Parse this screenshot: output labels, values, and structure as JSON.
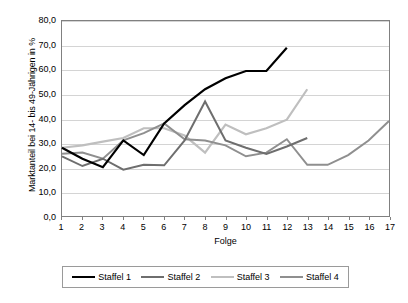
{
  "chart_data": {
    "type": "line",
    "title": "",
    "xlabel": "Folge",
    "ylabel": "Marktanteil bei 14- bis 49-Jährigen in %",
    "xlim": [
      1,
      17
    ],
    "ylim": [
      0,
      80
    ],
    "grid": true,
    "legend_position": "bottom",
    "x_tick_labels": [
      "1",
      "2",
      "3",
      "4",
      "5",
      "6",
      "7",
      "8",
      "9",
      "10",
      "11",
      "12",
      "13",
      "14",
      "15",
      "16",
      "17"
    ],
    "y_tick_labels": [
      "0,0",
      "10,0",
      "20,0",
      "30,0",
      "40,0",
      "50,0",
      "60,0",
      "70,0",
      "80,0"
    ],
    "y_ticks": [
      0,
      10,
      20,
      30,
      40,
      50,
      60,
      70,
      80
    ],
    "x": [
      1,
      2,
      3,
      4,
      5,
      6,
      7,
      8,
      9,
      10,
      11,
      12,
      13,
      14,
      15,
      16,
      17
    ],
    "series": [
      {
        "name": "Staffel 1",
        "color": "#000000",
        "width": 2.2,
        "x": [
          1,
          2,
          3,
          4,
          5,
          6,
          7,
          8,
          9,
          10,
          11,
          12
        ],
        "values": [
          28.0,
          23.5,
          20.0,
          31.0,
          25.0,
          38.0,
          45.5,
          52.0,
          56.5,
          59.5,
          59.5,
          69.0
        ]
      },
      {
        "name": "Staffel 2",
        "color": "#6e6e6e",
        "width": 2.0,
        "x": [
          1,
          2,
          3,
          4,
          5,
          6,
          7,
          8,
          9,
          10,
          11,
          12,
          13
        ],
        "values": [
          24.5,
          20.5,
          23.5,
          19.0,
          21.0,
          20.8,
          31.0,
          47.0,
          31.0,
          28.0,
          25.5,
          28.5,
          32.0
        ]
      },
      {
        "name": "Staffel 3",
        "color": "#bfbfbf",
        "width": 2.2,
        "x": [
          1,
          2,
          3,
          4,
          5,
          6,
          7,
          8,
          9,
          10,
          11,
          12,
          13
        ],
        "values": [
          28.0,
          29.0,
          30.5,
          32.0,
          36.0,
          36.0,
          33.0,
          26.0,
          37.5,
          33.5,
          36.0,
          39.5,
          52.0
        ]
      },
      {
        "name": "Staffel 4",
        "color": "#8f8f8f",
        "width": 2.0,
        "x": [
          1,
          2,
          3,
          4,
          5,
          6,
          7,
          8,
          9,
          10,
          11,
          12,
          13,
          14,
          15,
          16,
          17
        ],
        "values": [
          25.5,
          26.0,
          23.5,
          31.0,
          34.0,
          38.0,
          31.5,
          31.0,
          29.0,
          24.5,
          26.0,
          31.5,
          21.0,
          21.0,
          25.0,
          31.0,
          39.0
        ]
      }
    ]
  },
  "legend": {
    "items": [
      {
        "label": "Staffel 1"
      },
      {
        "label": "Staffel 2"
      },
      {
        "label": "Staffel 3"
      },
      {
        "label": "Staffel 4"
      }
    ]
  }
}
